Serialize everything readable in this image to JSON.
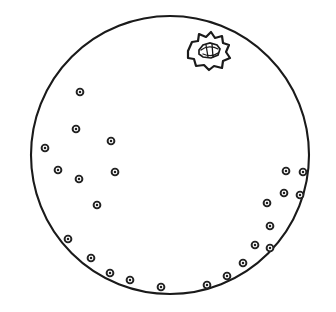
{
  "figure": {
    "domain": "Diagram",
    "title": "",
    "caption": "",
    "background_color": "#ffffff",
    "line_color": "#1a1a1a",
    "canvas": {
      "width": 336,
      "height": 312
    }
  },
  "cell": {
    "name": "cell-outline",
    "shape": "circle",
    "center_x": 170,
    "center_y": 155,
    "radius": 139,
    "stroke_width": 2.1,
    "fill": "#ffffff",
    "stroke": "#1a1a1a"
  },
  "inclusion": {
    "name": "irregular-body",
    "label": "",
    "description": "irregular star-lobed body with inner lens-shaped structure",
    "center_x": 208,
    "center_y": 51,
    "outer_radius_mean": 20,
    "lobe_count": 11,
    "outer_points": "188,51 192,42 198,41 199,34 206,37 211,32 215,38 222,36 223,43 229,45 226,52 230,58 223,61 222,68 214,66 209,70 204,65 196,66 194,59 188,58",
    "inner_points": "199,50 203,45 210,43 217,45 220,49 218,55 211,58 203,57 199,54",
    "detail_strokes": [
      "M 201,50 C 206,46 213,46 218,49",
      "M 203,54 C 208,56 214,56 218,53",
      "M 206,45 L 208,57",
      "M 212,44 L 213,57"
    ]
  },
  "granules": {
    "name": "granule-set",
    "count": 24,
    "radius_outer": 3.4,
    "radius_inner": 1.25,
    "stroke": "#222222",
    "fill": "#ffffff",
    "points": [
      {
        "id": "g1",
        "x": 80,
        "y": 92
      },
      {
        "id": "g2",
        "x": 76,
        "y": 129
      },
      {
        "id": "g3",
        "x": 111,
        "y": 141
      },
      {
        "id": "g4",
        "x": 45,
        "y": 148
      },
      {
        "id": "g5",
        "x": 58,
        "y": 170
      },
      {
        "id": "g6",
        "x": 115,
        "y": 172
      },
      {
        "id": "g7",
        "x": 79,
        "y": 179
      },
      {
        "id": "g8",
        "x": 97,
        "y": 205
      },
      {
        "id": "g9",
        "x": 68,
        "y": 239
      },
      {
        "id": "g10",
        "x": 91,
        "y": 258
      },
      {
        "id": "g11",
        "x": 110,
        "y": 273
      },
      {
        "id": "g12",
        "x": 130,
        "y": 280
      },
      {
        "id": "g13",
        "x": 161,
        "y": 287
      },
      {
        "id": "g14",
        "x": 207,
        "y": 285
      },
      {
        "id": "g15",
        "x": 227,
        "y": 276
      },
      {
        "id": "g16",
        "x": 243,
        "y": 263
      },
      {
        "id": "g17",
        "x": 255,
        "y": 245
      },
      {
        "id": "g18",
        "x": 270,
        "y": 248
      },
      {
        "id": "g19",
        "x": 270,
        "y": 226
      },
      {
        "id": "g20",
        "x": 267,
        "y": 203
      },
      {
        "id": "g21",
        "x": 284,
        "y": 193
      },
      {
        "id": "g22",
        "x": 286,
        "y": 171
      },
      {
        "id": "g23",
        "x": 303,
        "y": 172
      },
      {
        "id": "g24",
        "x": 300,
        "y": 195
      }
    ]
  }
}
